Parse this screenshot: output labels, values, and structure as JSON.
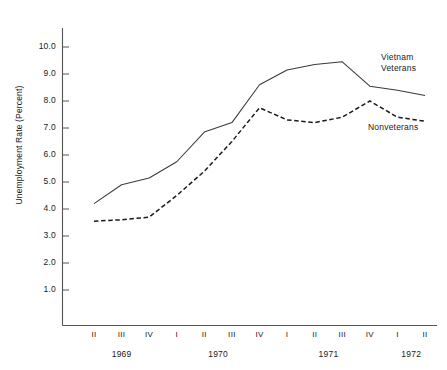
{
  "chart_data": {
    "type": "line",
    "title": "",
    "xlabel": "",
    "ylabel": "Unemployment Rate (Percent)",
    "ylim": [
      0.0,
      10.6
    ],
    "yticks": [
      "1.0",
      "2.0",
      "3.0",
      "4.0",
      "5.0",
      "6.0",
      "7.0",
      "8.0",
      "9.0",
      "10.0"
    ],
    "ytick_values": [
      1.0,
      2.0,
      3.0,
      4.0,
      5.0,
      6.0,
      7.0,
      8.0,
      9.0,
      10.0
    ],
    "grid": false,
    "legend_position": "inline-right",
    "categories": [
      "II",
      "III",
      "IV",
      "I",
      "II",
      "III",
      "IV",
      "I",
      "II",
      "III",
      "IV",
      "I",
      "II"
    ],
    "year_groups": [
      {
        "label": "1969",
        "quarters": [
          "II",
          "III",
          "IV"
        ]
      },
      {
        "label": "1970",
        "quarters": [
          "I",
          "II",
          "III",
          "IV"
        ]
      },
      {
        "label": "1971",
        "quarters": [
          "I",
          "II",
          "III",
          "IV"
        ]
      },
      {
        "label": "1972",
        "quarters": [
          "I",
          "II"
        ]
      }
    ],
    "series": [
      {
        "name": "Vietnam Veterans",
        "label_lines": [
          "Vietnam",
          "Veterans"
        ],
        "style": "solid",
        "color": "#3a3a3a",
        "values": [
          4.2,
          4.9,
          5.15,
          5.75,
          6.85,
          7.2,
          8.6,
          9.15,
          9.35,
          9.45,
          8.55,
          8.4,
          8.2
        ]
      },
      {
        "name": "Nonveterans",
        "label_lines": [
          "Nonveterans"
        ],
        "style": "dashed",
        "color": "#1a1a1a",
        "values": [
          3.55,
          3.6,
          3.7,
          4.5,
          5.4,
          6.5,
          7.75,
          7.3,
          7.2,
          7.4,
          8.0,
          7.4,
          7.25
        ]
      }
    ]
  },
  "axes": {
    "axis_color": "#555555"
  }
}
